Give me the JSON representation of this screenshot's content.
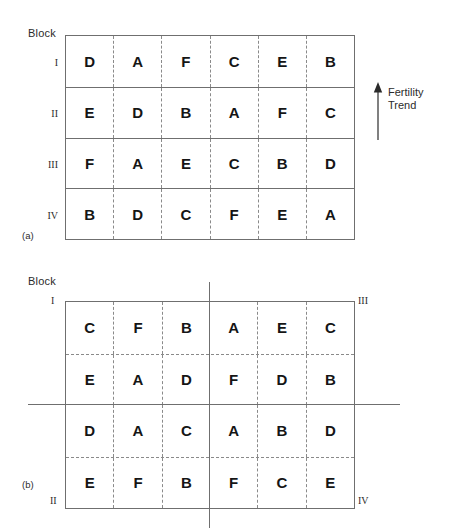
{
  "figure_a": {
    "block_label": "Block",
    "panel_label": "(a)",
    "row_labels": [
      "I",
      "II",
      "III",
      "IV"
    ],
    "rows": [
      [
        "D",
        "A",
        "F",
        "C",
        "E",
        "B"
      ],
      [
        "E",
        "D",
        "B",
        "A",
        "F",
        "C"
      ],
      [
        "F",
        "A",
        "E",
        "C",
        "B",
        "D"
      ],
      [
        "B",
        "D",
        "C",
        "F",
        "E",
        "A"
      ]
    ],
    "annotation": {
      "icon": "up-arrow-icon",
      "line1": "Fertility",
      "line2": "Trend"
    }
  },
  "figure_b": {
    "block_label": "Block",
    "panel_label": "(b)",
    "corners": {
      "top_left": "I",
      "top_right": "III",
      "bottom_left": "II",
      "bottom_right": "IV"
    },
    "rows": [
      [
        "C",
        "F",
        "B",
        "A",
        "E",
        "C"
      ],
      [
        "E",
        "A",
        "D",
        "F",
        "D",
        "B"
      ],
      [
        "D",
        "A",
        "C",
        "A",
        "B",
        "D"
      ],
      [
        "E",
        "F",
        "B",
        "F",
        "C",
        "E"
      ]
    ]
  },
  "colors": {
    "solid_line": "#6f6f6f",
    "dashed_line": "#8a8a8a",
    "letter": "#151515",
    "label": "#2b2b2b",
    "background": "#ffffff"
  }
}
